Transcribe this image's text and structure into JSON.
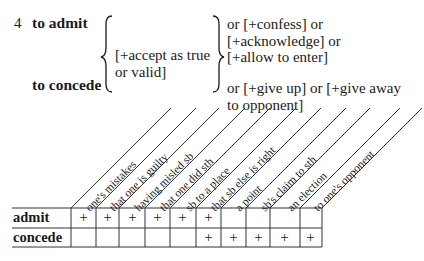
{
  "entry": {
    "number": "4",
    "headword_1": "to admit",
    "headword_2": "to concede",
    "shared_gloss_line1": "[+accept as true",
    "shared_gloss_line2": "or valid]",
    "admit_gloss_line1": "or [+confess] or",
    "admit_gloss_line2": "[+acknowledge] or",
    "admit_gloss_line3": "[+allow to enter]",
    "concede_gloss_line1": "or [+give up] or [+give away",
    "concede_gloss_line2": "to opponent]"
  },
  "grid": {
    "columns": [
      "one's mistakes",
      "that one is guilty",
      "having misled sb",
      "that one did sth",
      "sb to a place",
      "that sb else is right",
      "a point",
      "sb's claim to sth",
      "an election",
      "to one's opponent"
    ],
    "rows": [
      {
        "label": "admit",
        "cells": [
          "+",
          "+",
          "+",
          "+",
          "+",
          "+",
          "",
          "",
          "",
          ""
        ]
      },
      {
        "label": "concede",
        "cells": [
          "",
          "",
          "",
          "",
          "",
          "+",
          "+",
          "+",
          "+",
          "+"
        ]
      }
    ]
  }
}
